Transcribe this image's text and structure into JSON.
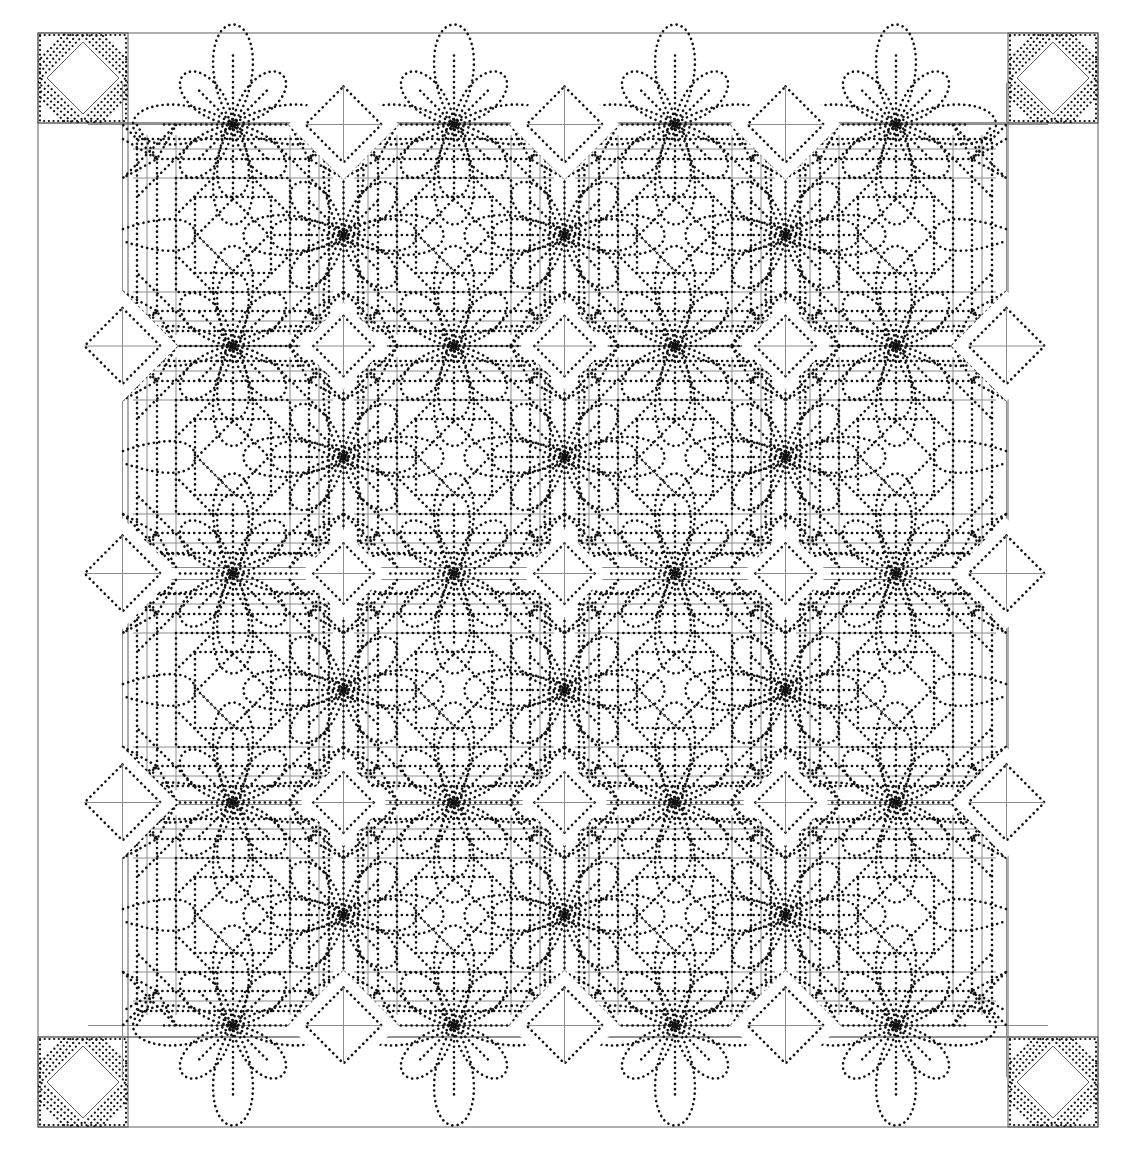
{
  "image": {
    "title": "Quilt quilting-pattern line drawing",
    "width": 1127,
    "height": 1159,
    "background": "#ffffff",
    "line_color": "#111111",
    "seam_color": "#8c8c8c"
  },
  "quilt": {
    "outer_frame": {
      "x": 38,
      "y": 33,
      "w": 1060,
      "h": 1094
    },
    "corner_block_size": 90,
    "corner_blocks": [
      {
        "position": "top-left",
        "x": 38,
        "y": 33
      },
      {
        "position": "top-right",
        "x": 1008,
        "y": 33
      },
      {
        "position": "bottom-left",
        "x": 38,
        "y": 1037
      },
      {
        "position": "bottom-right",
        "x": 1008,
        "y": 1037
      }
    ],
    "block_grid": {
      "rows": 4,
      "cols": 4
    },
    "block_centers_x": [
      233,
      454,
      675,
      896
    ],
    "block_centers_y": [
      235,
      457,
      690,
      915
    ],
    "block_pitch": 221,
    "motifs": {
      "center": "diamond-in-square (log cabin / pineapple style rings)",
      "junction": "eight-petal flower with dotted petals",
      "edge": "diamond setting pieces"
    }
  }
}
